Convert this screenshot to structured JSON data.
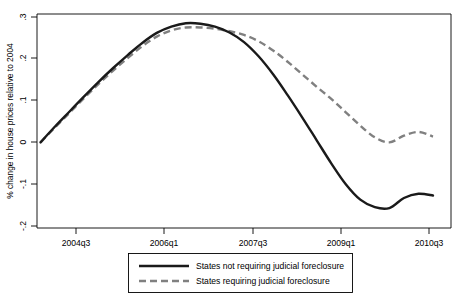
{
  "chart_data": {
    "type": "line",
    "title": "",
    "xlabel": "",
    "ylabel": "% change in house prices relative to 2004",
    "xlim": [
      0,
      27
    ],
    "ylim": [
      -0.2,
      0.3
    ],
    "grid": false,
    "legend_position": "bottom",
    "x_tick_labels": [
      "2004q3",
      "2006q1",
      "2007q3",
      "2009q1",
      "2010q3"
    ],
    "x_tick_values": [
      2,
      8,
      14,
      20,
      26
    ],
    "y_tick_labels": [
      ".3",
      ".2",
      ".1",
      "0",
      "-.1",
      "-.2"
    ],
    "y_tick_values": [
      0.3,
      0.2,
      0.1,
      0,
      -0.1,
      -0.2
    ],
    "x": [
      0,
      1,
      2,
      3,
      4,
      5,
      6,
      7,
      8,
      9,
      10,
      11,
      12,
      13,
      14,
      15,
      16,
      17,
      18,
      19,
      20,
      21,
      22,
      23,
      24,
      25,
      26,
      27
    ],
    "series": [
      {
        "name": "States not requiring judicial foreclosure",
        "style": "solid",
        "color": "#1a1a1a",
        "values": [
          0.0,
          0.038,
          0.074,
          0.11,
          0.145,
          0.178,
          0.209,
          0.238,
          0.262,
          0.277,
          0.285,
          0.284,
          0.277,
          0.263,
          0.24,
          0.206,
          0.163,
          0.113,
          0.06,
          0.005,
          -0.05,
          -0.1,
          -0.137,
          -0.155,
          -0.157,
          -0.133,
          -0.123,
          -0.127
        ]
      },
      {
        "name": "States requiring judicial foreclosure",
        "style": "dashed",
        "color": "#808080",
        "values": [
          0.0,
          0.036,
          0.071,
          0.106,
          0.14,
          0.172,
          0.202,
          0.23,
          0.253,
          0.268,
          0.275,
          0.275,
          0.272,
          0.266,
          0.257,
          0.242,
          0.22,
          0.193,
          0.163,
          0.133,
          0.104,
          0.072,
          0.04,
          0.012,
          0.0,
          0.016,
          0.025,
          0.014
        ]
      }
    ]
  },
  "legend": {
    "items": [
      {
        "label": "States not requiring judicial foreclosure",
        "style": "solid"
      },
      {
        "label": "States requiring judicial foreclosure",
        "style": "dashed"
      }
    ]
  }
}
